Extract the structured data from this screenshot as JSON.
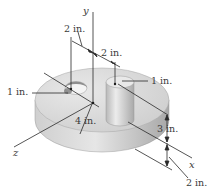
{
  "figure": {
    "axes": {
      "x": "x",
      "y": "y",
      "z": "z"
    },
    "dimensions": {
      "hole_offset_from_y": "2 in.",
      "boss_offset_from_y": "2 in.",
      "hole_radius": "1 in.",
      "boss_radius": "1 in.",
      "disk_radius": "4 in.",
      "boss_height": "3 in.",
      "disk_thickness": "2 in."
    },
    "colors": {
      "disk_top": "#d9d9d9",
      "disk_side": "#bdbdbd",
      "cylinder": "#cfcfcf",
      "lines": "#2a2a2a",
      "text": "#3a3a3a"
    }
  }
}
